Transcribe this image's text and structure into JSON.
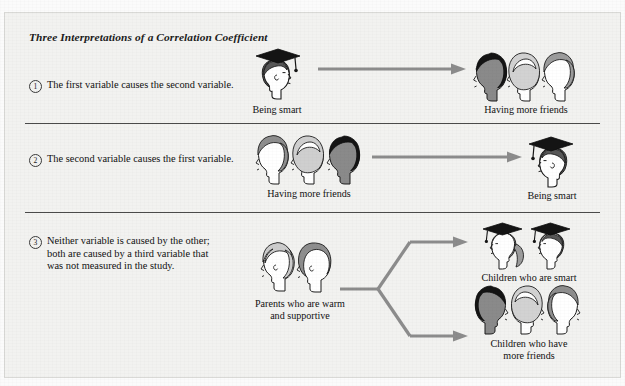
{
  "figure": {
    "title": "Three Interpretations of a Correlation Coefficient",
    "ghost_top": "",
    "background_color": "#f2f2f0",
    "border_color": "#d9d9d6",
    "arrow_color": "#8c8c8c",
    "rule_color": "#4a4a4a",
    "ink_color": "#111111"
  },
  "rows": [
    {
      "number": "1",
      "text": "The first variable causes the second variable.",
      "cause_label": "Being smart",
      "effect_label": "Having more friends",
      "arrow": "right-arrow"
    },
    {
      "number": "2",
      "text": "The second variable causes the first variable.",
      "cause_label": "Having more friends",
      "effect_label": "Being smart",
      "arrow": "right-arrow"
    },
    {
      "number": "3",
      "text_line1": "Neither variable is caused by the other;",
      "text_line2": "both are caused by a third variable that",
      "text_line3": "was not measured in the study.",
      "cause_label_line1": "Parents who are warm",
      "cause_label_line2": "and supportive",
      "effect_top_label": "Children who are smart",
      "effect_bottom_label_line1": "Children who have",
      "effect_bottom_label_line2": "more friends",
      "arrow": "branching-right-arrow"
    }
  ],
  "icons": {
    "graduate": "graduate-head-icon",
    "head_dark": "dark-haired-head-icon",
    "head_light": "light-haired-head-icon",
    "head_gray": "gray-haired-head-icon",
    "parent_balding": "balding-parent-head-icon",
    "parent_haired": "haired-parent-head-icon",
    "graduate_ponytail": "graduate-ponytail-head-icon"
  },
  "colors": {
    "skin_light": "#ffffff",
    "skin_dark": "#7f7f7f",
    "hair_black": "#1f1f1f",
    "hair_gray": "#9a9a9a",
    "hair_lightgray": "#cfcfcf",
    "cap_black": "#111111"
  }
}
